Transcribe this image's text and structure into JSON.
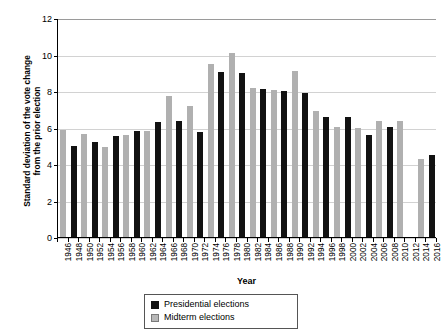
{
  "chart_data": {
    "type": "bar",
    "title": "",
    "xlabel": "Year",
    "ylabel_line1": "Standard deviation of the vote change",
    "ylabel_line2": "from the prior election",
    "ylim": [
      0,
      12
    ],
    "yticks": [
      0,
      2,
      4,
      6,
      8,
      10,
      12
    ],
    "ytick_labels": [
      "0",
      "2",
      "4",
      "6",
      "8",
      "10",
      "12"
    ],
    "grid": true,
    "legend_position": "bottom-center",
    "categories": [
      "1946",
      "1948",
      "1950",
      "1952",
      "1954",
      "1956",
      "1958",
      "1960",
      "1962",
      "1964",
      "1966",
      "1968",
      "1970",
      "1972",
      "1974",
      "1976",
      "1978",
      "1980",
      "1982",
      "1984",
      "1986",
      "1988",
      "1990",
      "1992",
      "1994",
      "1996",
      "1998",
      "2000",
      "2002",
      "2004",
      "2006",
      "2008",
      "2010",
      "2012",
      "2014",
      "2016"
    ],
    "series": [
      {
        "name": "Presidential elections",
        "color": "#121212",
        "values": [
          null,
          5.0,
          null,
          5.2,
          null,
          5.55,
          null,
          5.8,
          null,
          6.3,
          null,
          6.35,
          null,
          5.75,
          null,
          9.05,
          null,
          9.0,
          null,
          8.1,
          null,
          8.0,
          null,
          7.9,
          null,
          6.55,
          null,
          6.55,
          null,
          5.6,
          null,
          6.05,
          null,
          null,
          null,
          4.5
        ]
      },
      {
        "name": "Midterm elections",
        "color": "#b0b0b0",
        "values": [
          5.85,
          null,
          5.65,
          null,
          4.95,
          null,
          5.6,
          null,
          5.8,
          null,
          7.75,
          null,
          7.2,
          null,
          9.5,
          null,
          10.1,
          null,
          8.15,
          null,
          8.05,
          null,
          9.1,
          null,
          6.9,
          null,
          6.05,
          null,
          5.95,
          null,
          6.35,
          null,
          6.35,
          null,
          4.3,
          null
        ]
      }
    ],
    "legend": [
      {
        "label": "Presidential elections",
        "swatch": "pres"
      },
      {
        "label": "Midterm elections",
        "swatch": "mid"
      }
    ]
  }
}
